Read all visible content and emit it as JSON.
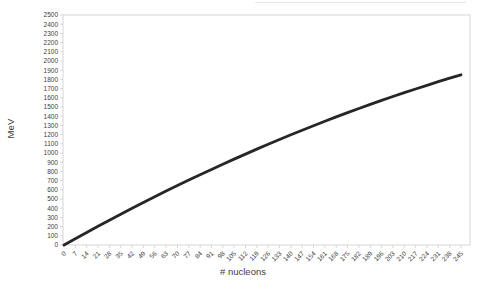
{
  "chart_data": {
    "type": "line",
    "title": "",
    "xlabel": "# nucleons",
    "ylabel": "MeV",
    "x": [
      0,
      7,
      14,
      21,
      28,
      35,
      42,
      49,
      56,
      63,
      70,
      77,
      84,
      91,
      98,
      105,
      112,
      119,
      126,
      133,
      140,
      147,
      154,
      161,
      168,
      175,
      182,
      189,
      196,
      203,
      210,
      217,
      224,
      231,
      238,
      245
    ],
    "series": [
      {
        "values": [
          0,
          69,
          137,
          204,
          270,
          335,
          399,
          462,
          524,
          586,
          646,
          706,
          764,
          822,
          878,
          934,
          988,
          1042,
          1095,
          1147,
          1198,
          1248,
          1297,
          1345,
          1392,
          1439,
          1484,
          1528,
          1572,
          1614,
          1656,
          1696,
          1736,
          1775,
          1813,
          1850
        ]
      }
    ],
    "xlim": [
      0,
      245
    ],
    "ylim": [
      0,
      2500
    ],
    "x_tick_step": 7,
    "y_tick_step": 100,
    "grid": false,
    "legend": false,
    "line_color": "#262626",
    "axis_color": "#d6d6d6",
    "tick_label_color": "#404040"
  }
}
